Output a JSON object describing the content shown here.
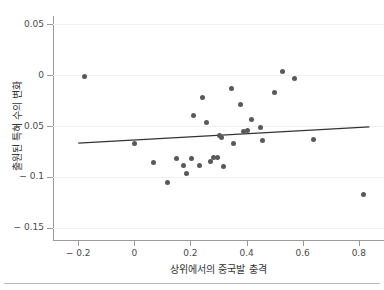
{
  "figure": {
    "top_clip_text": "",
    "background_color": "#ffffff",
    "point_color": "#595959",
    "fit_line_color": "#333333",
    "grid_color": "#f0f0f0",
    "axis_color": "#9a9a9a"
  },
  "chart_data": {
    "type": "scatter",
    "title": "",
    "xlabel": "상위에서의 중국발 충격",
    "ylabel": "출원된 특허 수의 변화",
    "xlim": [
      -0.29,
      0.89
    ],
    "ylim": [
      -0.162,
      0.058
    ],
    "xticks": [
      -0.2,
      0,
      0.2,
      0.4,
      0.6,
      0.8
    ],
    "xtick_labels": [
      "− 0.2",
      "0",
      "0.2",
      "0.4",
      "0.6",
      "0.8"
    ],
    "yticks": [
      0.05,
      0,
      -0.05,
      -0.1,
      -0.15
    ],
    "ytick_labels": [
      "0.05",
      "0",
      "− 0.05",
      "− 0.1",
      "− 0.15"
    ],
    "grid": "horizontal",
    "legend": "none",
    "points": [
      {
        "x": -0.178,
        "y": -0.0015
      },
      {
        "x": 0.0,
        "y": -0.0675
      },
      {
        "x": 0.068,
        "y": -0.0862
      },
      {
        "x": 0.118,
        "y": -0.1055
      },
      {
        "x": 0.149,
        "y": -0.0818
      },
      {
        "x": 0.176,
        "y": -0.0888
      },
      {
        "x": 0.186,
        "y": -0.0962
      },
      {
        "x": 0.205,
        "y": -0.0818
      },
      {
        "x": 0.21,
        "y": -0.0398
      },
      {
        "x": 0.232,
        "y": -0.0888
      },
      {
        "x": 0.242,
        "y": -0.0218
      },
      {
        "x": 0.258,
        "y": -0.0468
      },
      {
        "x": 0.272,
        "y": -0.0848
      },
      {
        "x": 0.282,
        "y": -0.0812
      },
      {
        "x": 0.296,
        "y": -0.0812
      },
      {
        "x": 0.305,
        "y": -0.0598
      },
      {
        "x": 0.312,
        "y": -0.0612
      },
      {
        "x": 0.318,
        "y": -0.0898
      },
      {
        "x": 0.346,
        "y": -0.013
      },
      {
        "x": 0.352,
        "y": -0.0675
      },
      {
        "x": 0.378,
        "y": -0.0288
      },
      {
        "x": 0.39,
        "y": -0.0555
      },
      {
        "x": 0.402,
        "y": -0.0545
      },
      {
        "x": 0.418,
        "y": -0.0432
      },
      {
        "x": 0.448,
        "y": -0.0512
      },
      {
        "x": 0.455,
        "y": -0.064
      },
      {
        "x": 0.498,
        "y": -0.0175
      },
      {
        "x": 0.528,
        "y": 0.0035
      },
      {
        "x": 0.572,
        "y": -0.0032
      },
      {
        "x": 0.64,
        "y": -0.0628
      },
      {
        "x": 0.818,
        "y": -0.1168
      }
    ],
    "fit_line": {
      "name": "linear fit",
      "x": [
        -0.2,
        0.838
      ],
      "y": [
        -0.0668,
        -0.0508
      ]
    }
  }
}
